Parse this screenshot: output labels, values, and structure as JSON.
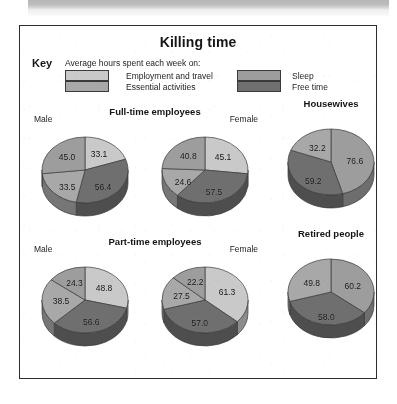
{
  "figure": {
    "title": "Killing time",
    "key": {
      "label": "Key",
      "caption": "Average hours spent each week on:",
      "entries": [
        {
          "name": "employment-and-travel",
          "label": "Employment and travel",
          "color": "#c9c9c9"
        },
        {
          "name": "essential-activities",
          "label": "Essential activities",
          "color": "#a8a8a8"
        },
        {
          "name": "sleep",
          "label": "Sleep",
          "color": "#9d9d9d"
        },
        {
          "name": "free-time",
          "label": "Free time",
          "color": "#6f6f6f"
        }
      ]
    },
    "group_titles": {
      "full_time": "Full-time employees",
      "part_time": "Part-time employees",
      "housewives": "Housewives",
      "retired": "Retired people"
    },
    "sub_labels": {
      "male": "Male",
      "female": "Female"
    }
  },
  "chart_data": {
    "type": "pie",
    "title": "Killing time",
    "units": "hours per week",
    "legend": [
      "Employment and travel",
      "Essential activities",
      "Sleep",
      "Free time"
    ],
    "legend_position": "top",
    "colors": [
      "#c9c9c9",
      "#a8a8a8",
      "#9d9d9d",
      "#6f6f6f"
    ],
    "charts": [
      {
        "name": "full-time-male",
        "group": "Full-time employees",
        "subject": "Male",
        "labels": [
          "Employment and travel",
          "Free time",
          "Essential activities",
          "Sleep"
        ],
        "values": [
          33.1,
          56.4,
          33.5,
          45.0
        ]
      },
      {
        "name": "full-time-female",
        "group": "Full-time employees",
        "subject": "Female",
        "labels": [
          "Employment and travel",
          "Free time",
          "Essential activities",
          "Sleep"
        ],
        "values": [
          45.1,
          57.5,
          24.6,
          40.8
        ]
      },
      {
        "name": "housewives",
        "group": "Housewives",
        "subject": "",
        "labels": [
          "Sleep",
          "Free time",
          "Essential activities"
        ],
        "values": [
          76.6,
          59.2,
          32.2
        ]
      },
      {
        "name": "part-time-male",
        "group": "Part-time employees",
        "subject": "Male",
        "labels": [
          "Employment and travel",
          "Free time",
          "Essential activities",
          "Sleep"
        ],
        "values": [
          48.8,
          56.6,
          38.5,
          24.3
        ]
      },
      {
        "name": "part-time-female",
        "group": "Part-time employees",
        "subject": "Female",
        "labels": [
          "Employment and travel",
          "Free time",
          "Essential activities",
          "Sleep"
        ],
        "values": [
          61.3,
          57.0,
          27.5,
          22.2
        ]
      },
      {
        "name": "retired-people",
        "group": "Retired people",
        "subject": "",
        "labels": [
          "Sleep",
          "Free time",
          "Essential activities"
        ],
        "values": [
          60.2,
          58.0,
          49.8
        ]
      }
    ]
  }
}
